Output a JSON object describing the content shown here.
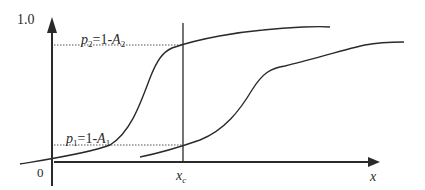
{
  "diagram": {
    "y_axis": {
      "top_label": "1.0",
      "origin_label": "0"
    },
    "x_axis": {
      "label": "x",
      "marker_label_main": "x",
      "marker_label_sub": "c"
    },
    "levels": [
      {
        "name": "p1",
        "label_var": "p",
        "label_sub": "1",
        "label_eq": "=1-",
        "label_A": "A",
        "label_A_sub": "1"
      },
      {
        "name": "p2",
        "label_var": "p",
        "label_sub": "2",
        "label_eq": "=1-",
        "label_A": "A",
        "label_A_sub": "2"
      }
    ],
    "curves": [
      {
        "name": "left-sigmoid-curve"
      },
      {
        "name": "right-sigmoid-curve"
      }
    ],
    "colors": {
      "line": "#2a2a2a",
      "dotted": "#555555"
    }
  }
}
